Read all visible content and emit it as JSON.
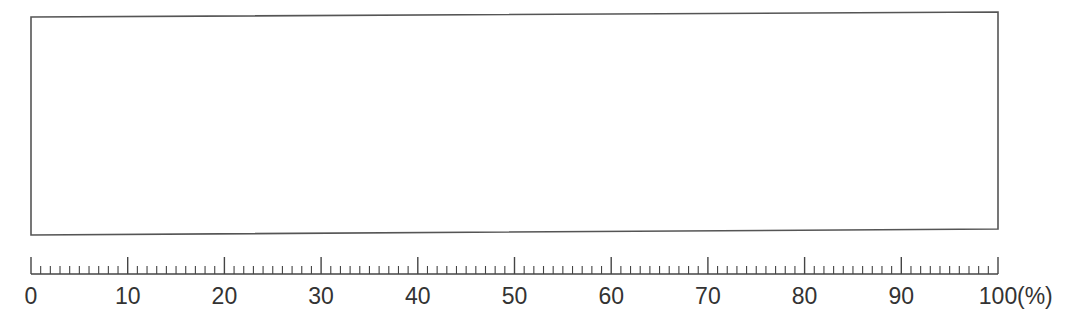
{
  "diagram": {
    "type": "percentage-scale-with-empty-box",
    "box": {
      "corners": {
        "top_left": [
          31,
          17
        ],
        "top_right": [
          998,
          12
        ],
        "bottom_right": [
          998,
          229
        ],
        "bottom_left": [
          31,
          235
        ]
      },
      "stroke": "#555555",
      "fill": "#ffffff"
    },
    "scale": {
      "x_start": 31,
      "x_end": 998,
      "baseline_y": 274,
      "min": 0,
      "max": 100,
      "major_step": 10,
      "minor_step": 1,
      "major_tick_top": 257,
      "minor_tick_top": 266,
      "stroke": "#444444",
      "labels": [
        "0",
        "10",
        "20",
        "30",
        "40",
        "50",
        "60",
        "70",
        "80",
        "90",
        "100"
      ],
      "unit": "(%)"
    }
  }
}
